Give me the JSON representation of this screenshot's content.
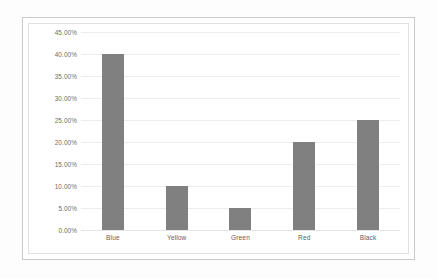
{
  "chart_data": {
    "type": "bar",
    "title": "",
    "subtitle": "",
    "xlabel": "",
    "ylabel": "",
    "categories": [
      "Blue",
      "Yellow",
      "Green",
      "Red",
      "Black"
    ],
    "values": [
      40.0,
      10.0,
      5.0,
      20.0,
      25.0
    ],
    "value_labels": [
      "40.00%",
      "10.00%",
      "5.00%",
      "20.00%",
      "25.00%"
    ],
    "ylim": [
      0,
      45
    ],
    "ytick_values": [
      0,
      5,
      10,
      15,
      20,
      25,
      30,
      35,
      40,
      45
    ],
    "ytick_labels": [
      "0.00%",
      "5.00%",
      "10.00%",
      "15.00%",
      "20.00%",
      "25.00%",
      "30.00%",
      "35.00%",
      "40.00%",
      "45.00%"
    ],
    "grid": true,
    "legend": false,
    "legend_position": "none",
    "annotations": [],
    "colors": {
      "bar_fill": "#808080",
      "gridline": "#ededed",
      "baseline": "#e4e4e4",
      "tick_text": "#6d6d6d",
      "category_text": "#5f5f5f",
      "outer_border": "#c9c9c9",
      "inner_border": "#e0e0e0",
      "plot_background": "#ffffff",
      "page_background": "#fdfdfd"
    }
  }
}
